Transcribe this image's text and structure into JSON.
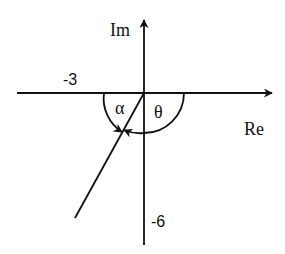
{
  "diagram": {
    "title": "",
    "axes": {
      "real_label": "Re",
      "imag_label": "Im"
    },
    "tick_labels": {
      "real": "-3",
      "imag": "-6"
    },
    "angles": {
      "alpha": "α",
      "theta": "θ"
    },
    "colors": {
      "line": "#111111",
      "background": "#ffffff"
    }
  }
}
